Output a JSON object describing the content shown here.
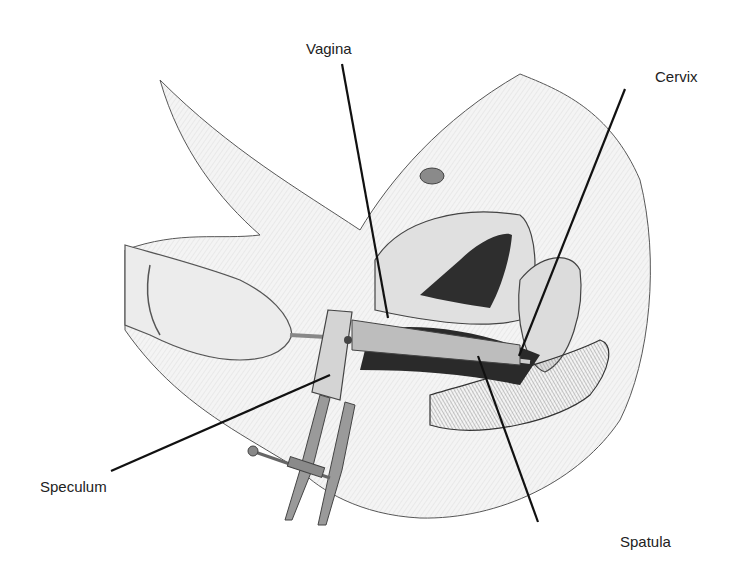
{
  "figure": {
    "labels": {
      "vagina": "Vagina",
      "cervix": "Cervix",
      "speculum": "Speculum",
      "spatula": "Spatula"
    }
  },
  "colors": {
    "ink": "#1a1a1a",
    "shade_dark": "#2e2e2e",
    "shade_mid": "#8a8a8a",
    "shade_light": "#d9d9d9",
    "skin": "#efefef"
  }
}
